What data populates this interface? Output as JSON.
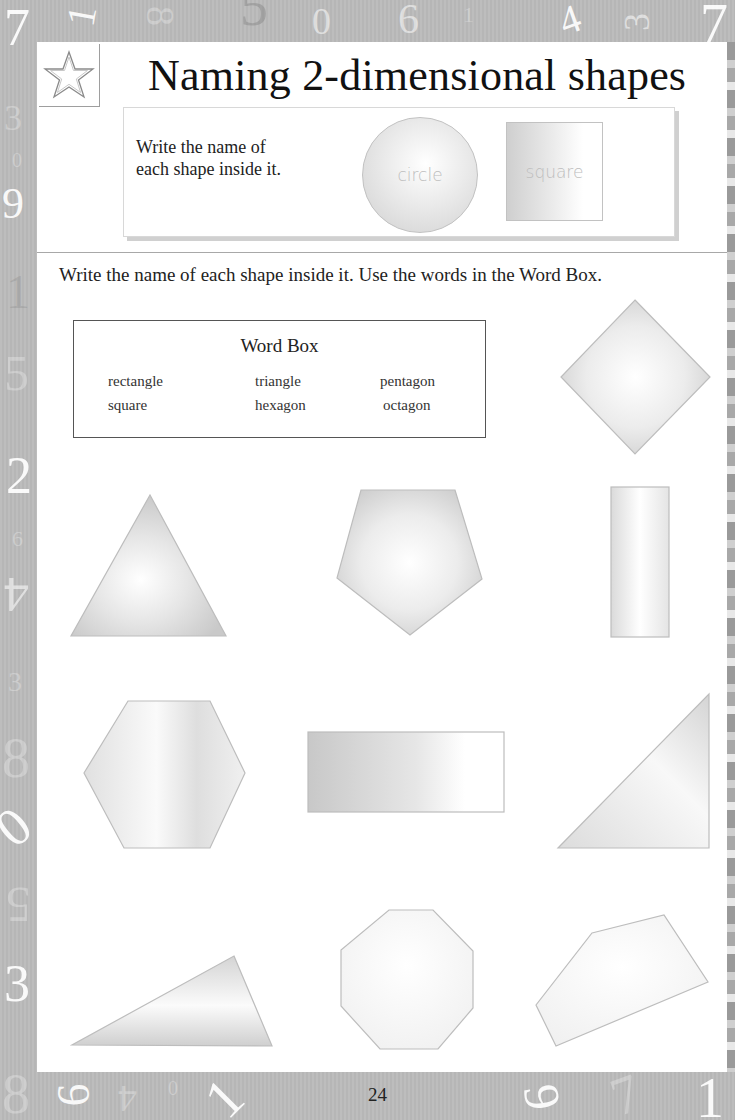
{
  "page": {
    "title": "Naming 2-dimensional shapes",
    "page_number": "24",
    "icon": "star-icon"
  },
  "example": {
    "instruction_line1": "Write the name of",
    "instruction_line2": "each shape inside it.",
    "shapes": [
      {
        "shape": "circle",
        "label": "circle"
      },
      {
        "shape": "square",
        "label": "square"
      }
    ]
  },
  "exercise": {
    "instruction": "Write the name of each shape inside it. Use the words in the Word Box.",
    "word_box": {
      "title": "Word Box",
      "words": [
        "rectangle",
        "triangle",
        "pentagon",
        "square",
        "hexagon",
        "octagon"
      ]
    },
    "shapes": [
      {
        "id": "diamond-square",
        "answer": ""
      },
      {
        "id": "equilateral-triangle",
        "answer": ""
      },
      {
        "id": "pentagon",
        "answer": ""
      },
      {
        "id": "tall-rectangle",
        "answer": ""
      },
      {
        "id": "hexagon",
        "answer": ""
      },
      {
        "id": "wide-rectangle",
        "answer": ""
      },
      {
        "id": "right-triangle",
        "answer": ""
      },
      {
        "id": "scalene-triangle",
        "answer": ""
      },
      {
        "id": "octagon",
        "answer": ""
      },
      {
        "id": "irregular-pentagon",
        "answer": ""
      }
    ]
  },
  "border_numbers": {
    "top": [
      "7",
      "1",
      "8",
      "5",
      "0",
      "6",
      "1",
      "4",
      "3",
      "7"
    ],
    "left": [
      "3",
      "0",
      "9",
      "1",
      "5",
      "2",
      "6",
      "4",
      "3",
      "8",
      "0",
      "5",
      "3"
    ],
    "bottom": [
      "8",
      "6",
      "4",
      "0",
      "1",
      "9",
      "7",
      "1"
    ]
  },
  "colors": {
    "frame": "#b9b9b9",
    "page": "#ffffff",
    "shape_fill_light": "#f4f4f4",
    "shape_fill_dark": "#cfcfcf",
    "shape_stroke": "#bdbdbd",
    "text": "#222222"
  }
}
